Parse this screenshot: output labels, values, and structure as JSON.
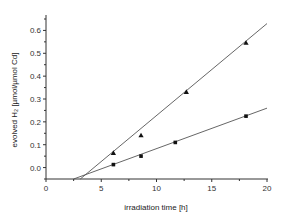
{
  "chart_data": {
    "type": "scatter",
    "title": "",
    "xlabel": "irradiation time [h]",
    "ylabel": "evolved H₂ [µmol/µmol Cd]",
    "xlim": [
      0,
      20
    ],
    "ylim": [
      -0.05,
      0.65
    ],
    "x_ticks": [
      0,
      5,
      10,
      15,
      20
    ],
    "x_tick_labels": [
      "0",
      "5",
      "10",
      "15",
      "20"
    ],
    "y_ticks": [
      0.0,
      0.1,
      0.2,
      0.3,
      0.4,
      0.5,
      0.6
    ],
    "y_tick_labels": [
      "0.0",
      "0.1",
      "0.2",
      "0.3",
      "0.4",
      "0.5",
      "0.6"
    ],
    "grid": false,
    "legend": null,
    "series": [
      {
        "name": "triangles",
        "marker": "triangle",
        "x": [
          6.1,
          8.6,
          12.7,
          18.1
        ],
        "y": [
          0.063,
          0.14,
          0.33,
          0.545
        ],
        "fit_line": {
          "x": [
            3.1,
            20
          ],
          "y": [
            -0.05,
            0.63
          ]
        }
      },
      {
        "name": "squares",
        "marker": "square",
        "x": [
          6.1,
          8.6,
          11.7,
          18.1
        ],
        "y": [
          0.013,
          0.05,
          0.11,
          0.225
        ],
        "fit_line": {
          "x": [
            2.5,
            20
          ],
          "y": [
            -0.05,
            0.26
          ]
        }
      }
    ]
  }
}
